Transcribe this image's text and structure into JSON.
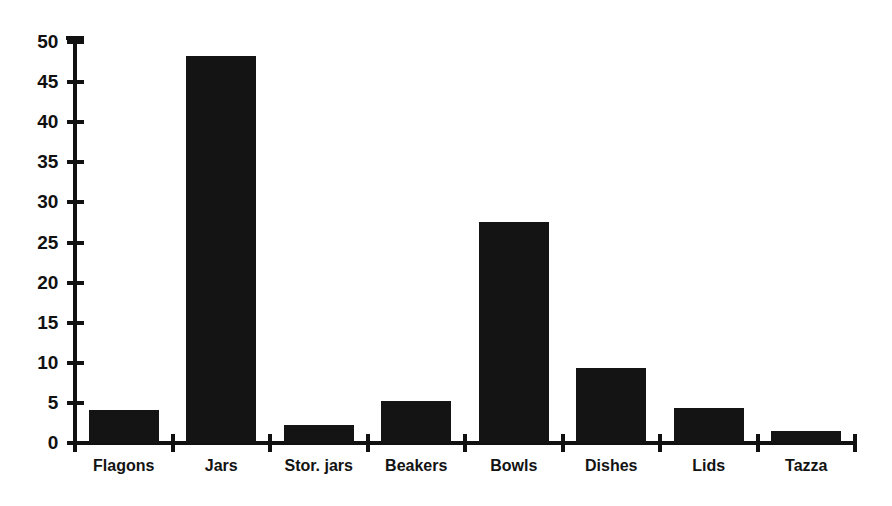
{
  "chart_data": {
    "type": "bar",
    "title": "",
    "subtitle": "",
    "xlabel": "",
    "ylabel": "",
    "categories": [
      "Flagons",
      "Jars",
      "Stor. jars",
      "Beakers",
      "Bowls",
      "Dishes",
      "Lids",
      "Tazza"
    ],
    "values": [
      4.1,
      48.3,
      2.2,
      5.2,
      27.5,
      9.4,
      4.4,
      1.5
    ],
    "ylim": [
      0,
      50
    ],
    "ytick_labels": [
      "50",
      "45",
      "40",
      "35",
      "30",
      "25",
      "20",
      "15",
      "10",
      "5",
      "0"
    ],
    "ytick_values": [
      50,
      45,
      40,
      35,
      30,
      25,
      20,
      15,
      10,
      5,
      0
    ],
    "ytick_interval": 5,
    "grid": false,
    "legend": [],
    "legend_position": "none",
    "bar_color": "#141414",
    "axis_color": "#111111",
    "background_color": "#ffffff",
    "annotations": []
  }
}
